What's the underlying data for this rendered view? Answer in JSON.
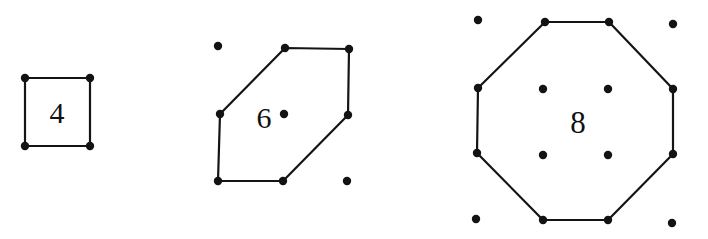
{
  "figure": {
    "background_color": "#ffffff",
    "ink_color": "#131313",
    "width": 708,
    "height": 239
  },
  "chart_data": {
    "type": "diagram",
    "xlabel": "",
    "ylabel": "",
    "categories": [
      "4",
      "6",
      "8"
    ],
    "values": [
      4,
      6,
      8
    ],
    "grid": false,
    "legend": null,
    "groups": [
      {
        "name": "square-group",
        "label": "4",
        "label_x": 57,
        "label_y": 112,
        "sides": 4,
        "polygon_points": "25,78 90,78 90,146 25,146",
        "vertices": [
          {
            "x": 25,
            "y": 78
          },
          {
            "x": 90,
            "y": 78
          },
          {
            "x": 90,
            "y": 146
          },
          {
            "x": 25,
            "y": 146
          }
        ],
        "interior_dots": [],
        "exterior_dots": [],
        "dot_radius": 4.2
      },
      {
        "name": "hexagon-group",
        "label": "6",
        "label_x": 264,
        "label_y": 117,
        "sides": 6,
        "polygon_points": "285,48 349,49 348,115 283,181 218,181 220,114",
        "vertices": [
          {
            "x": 285,
            "y": 48
          },
          {
            "x": 349,
            "y": 49
          },
          {
            "x": 348,
            "y": 115
          },
          {
            "x": 283,
            "y": 181
          },
          {
            "x": 218,
            "y": 181
          },
          {
            "x": 220,
            "y": 114
          }
        ],
        "interior_dots": [
          {
            "x": 284,
            "y": 114
          }
        ],
        "exterior_dots": [
          {
            "x": 218,
            "y": 46
          },
          {
            "x": 347,
            "y": 181
          }
        ],
        "dot_radius": 4.2
      },
      {
        "name": "octagon-group",
        "label": "8",
        "label_x": 578,
        "label_y": 122,
        "sides": 8,
        "polygon_points": "545,22 609,22 673,89 673,154 608,220 543,220 477,153 478,88",
        "vertices": [
          {
            "x": 545,
            "y": 22
          },
          {
            "x": 609,
            "y": 22
          },
          {
            "x": 673,
            "y": 89
          },
          {
            "x": 673,
            "y": 154
          },
          {
            "x": 608,
            "y": 220
          },
          {
            "x": 543,
            "y": 220
          },
          {
            "x": 477,
            "y": 153
          },
          {
            "x": 478,
            "y": 88
          }
        ],
        "interior_dots": [
          {
            "x": 543,
            "y": 89
          },
          {
            "x": 608,
            "y": 89
          },
          {
            "x": 543,
            "y": 155
          },
          {
            "x": 608,
            "y": 155
          }
        ],
        "exterior_dots": [
          {
            "x": 478,
            "y": 20
          },
          {
            "x": 673,
            "y": 24
          },
          {
            "x": 476,
            "y": 219
          },
          {
            "x": 672,
            "y": 223
          }
        ],
        "dot_radius": 4.2
      }
    ]
  }
}
